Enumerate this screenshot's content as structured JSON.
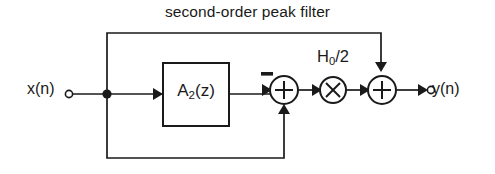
{
  "figure": {
    "title": "second-order peak filter",
    "type": "signal-flow-block-diagram",
    "background_color": "#ffffff",
    "line_color": "#1a1a1a"
  },
  "labels": {
    "input": "x(n)",
    "output": "y(n)",
    "allpass_block": "A2(z)",
    "allpass_block_base": "A",
    "allpass_block_sub": "2",
    "allpass_block_tail": "(z)",
    "gain": "H0/2",
    "gain_base": "H",
    "gain_sub": "0",
    "gain_tail": "/2",
    "sum_sign": "+",
    "product_sign": "×",
    "negative_sign": "−"
  },
  "nodes": [
    {
      "name": "input-terminal",
      "label": "x(n)",
      "kind": "terminal"
    },
    {
      "name": "branch-junction",
      "label": "",
      "kind": "junction-dot"
    },
    {
      "name": "allpass-block",
      "label": "A2(z)",
      "kind": "rect-block"
    },
    {
      "name": "first-adder",
      "label": "+",
      "kind": "summing-circle"
    },
    {
      "name": "gain-multiplier",
      "label": "×",
      "kind": "multiplier-circle"
    },
    {
      "name": "second-adder",
      "label": "+",
      "kind": "summing-circle"
    },
    {
      "name": "output-terminal",
      "label": "y(n)",
      "kind": "terminal"
    }
  ],
  "edges": [
    {
      "name": "input-to-junction",
      "from": "input-terminal",
      "to": "branch-junction"
    },
    {
      "name": "junction-to-allpass",
      "from": "branch-junction",
      "to": "allpass-block"
    },
    {
      "name": "allpass-to-first-adder",
      "from": "allpass-block",
      "to": "first-adder",
      "sign": "−"
    },
    {
      "name": "feedforward-bottom-path",
      "from": "branch-junction",
      "to": "first-adder",
      "sign": "+"
    },
    {
      "name": "first-adder-to-multiplier",
      "from": "first-adder",
      "to": "gain-multiplier"
    },
    {
      "name": "multiplier-to-second-adder",
      "from": "gain-multiplier",
      "to": "second-adder"
    },
    {
      "name": "feedforward-top-path",
      "from": "branch-junction",
      "to": "second-adder"
    },
    {
      "name": "second-adder-to-output",
      "from": "second-adder",
      "to": "output-terminal"
    }
  ]
}
